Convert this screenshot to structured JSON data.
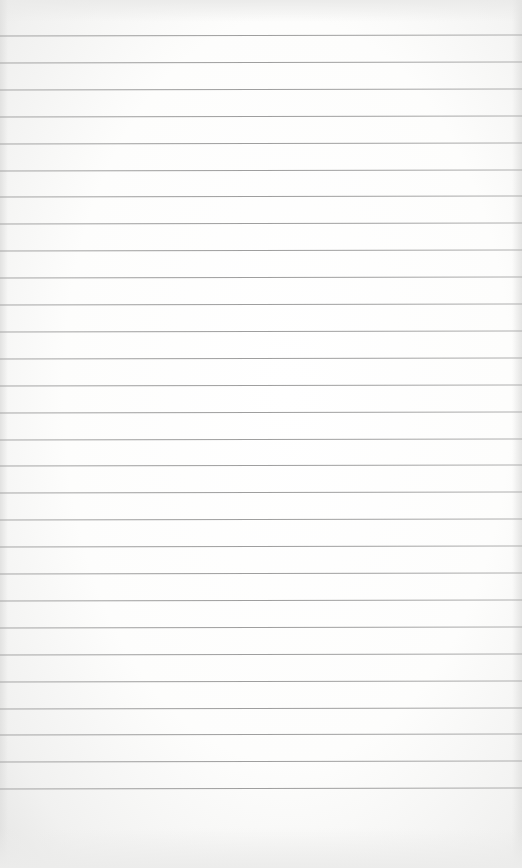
{
  "paper": {
    "type": "blank lined sheet",
    "background_color": "#fdfdfc",
    "rule_color": "#8e8e8e",
    "rules": {
      "count": 29,
      "first_y": 35,
      "spacing": 26.9
    },
    "text": ""
  }
}
